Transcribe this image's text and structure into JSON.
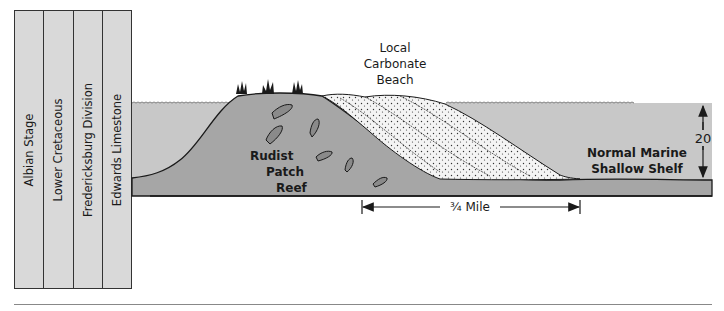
{
  "stratigraphy": {
    "columns": [
      {
        "label": "Albian Stage"
      },
      {
        "label": "Lower Cretaceous"
      },
      {
        "label": "Fredericksburg Division"
      },
      {
        "label": "Edwards Limestone"
      }
    ]
  },
  "diagram": {
    "labels": {
      "beach_line1": "Local",
      "beach_line2": "Carbonate",
      "beach_line3": "Beach",
      "reef_line1": "Rudist",
      "reef_line2": "Patch",
      "reef_line3": "Reef",
      "shelf_line1": "Normal Marine",
      "shelf_line2": "Shallow Shelf",
      "depth": "20",
      "scale": "¾ Mile"
    },
    "colors": {
      "water": "#c8c8c8",
      "reef": "#a6a6a6",
      "sand": "#f4f4f4",
      "outline": "#1a1a1a"
    }
  }
}
